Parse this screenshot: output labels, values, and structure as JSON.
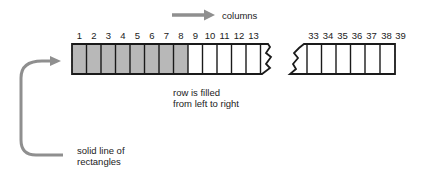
{
  "diagram": {
    "type": "array-row-illustration",
    "columns_arrow_label": "columns",
    "row_caption": [
      "row is filled",
      "from left to right"
    ],
    "side_caption": [
      "solid line of",
      "rectangles"
    ],
    "colors": {
      "filled_cell": "#b8b8b8",
      "empty_cell": "#ffffff",
      "outline": "#1a1a1a",
      "arrow": "#8f8f8f"
    },
    "segment_left": {
      "column_numbers": [
        "1",
        "2",
        "3",
        "4",
        "5",
        "6",
        "7",
        "8",
        "9",
        "10",
        "11",
        "12",
        "13"
      ],
      "filled_count": 8
    },
    "segment_right": {
      "column_numbers": [
        "33",
        "34",
        "35",
        "36",
        "37",
        "38",
        "39"
      ],
      "filled_count": 0
    }
  }
}
